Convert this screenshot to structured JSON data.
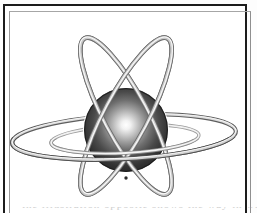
{
  "figure": {
    "name": "atom-orbital-model",
    "alt_title": "Shaded sphere encircled by tubular orbital rings",
    "background_color": "#ffffff",
    "frame": {
      "border_color": "#1c1c1c",
      "border_width_px": 2,
      "inner_rule_color": "#9a9a9a",
      "bottom_open": true
    },
    "nucleus": {
      "label": "nucleus-sphere",
      "center_x": 121,
      "center_y": 124,
      "radius": 42,
      "highlight_x": 120,
      "highlight_y": 118,
      "highlight_color": "#ffffff",
      "mid_color": "#5a5a5a",
      "edge_color": "#1a1a1a",
      "rim_color": "#0d0d0d"
    },
    "rings": [
      {
        "label": "orbit-ring-vertical-left",
        "orientation": "tilted-left",
        "rx": 22,
        "ry": 88,
        "rotate_deg": -28,
        "stroke_light": "#e8e8e8",
        "stroke_mid": "#9c9c9c",
        "stroke_dark": "#6e6e6e"
      },
      {
        "label": "orbit-ring-vertical-right",
        "orientation": "tilted-right",
        "rx": 22,
        "ry": 88,
        "rotate_deg": 28,
        "stroke_light": "#e8e8e8",
        "stroke_mid": "#9c9c9c",
        "stroke_dark": "#6e6e6e"
      },
      {
        "label": "orbit-ring-equator-outer",
        "orientation": "horizontal",
        "rx": 112,
        "ry": 22,
        "rotate_deg": -3,
        "stroke_light": "#ededed",
        "stroke_mid": "#8f8f8f",
        "stroke_dark": "#606060"
      },
      {
        "label": "orbit-ring-equator-inner",
        "orientation": "horizontal",
        "rx": 74,
        "ry": 14,
        "rotate_deg": -3,
        "stroke_light": "#f2f2f2",
        "stroke_mid": "#b4b4b4",
        "stroke_dark": "#8a8a8a"
      }
    ],
    "caption_sliver_text": "the illustration opposite shows the way in which"
  }
}
